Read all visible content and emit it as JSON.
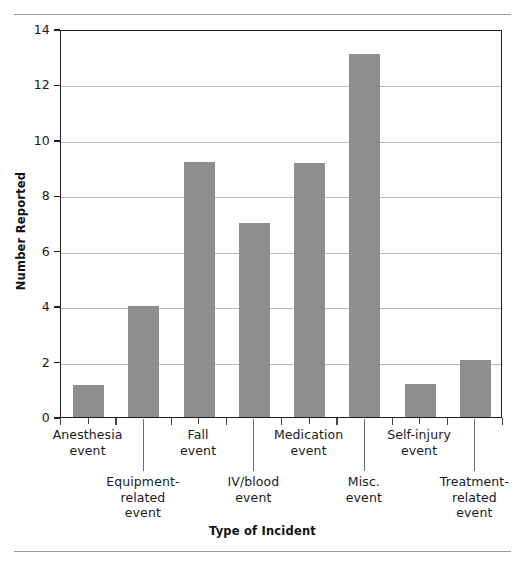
{
  "figure": {
    "background": "#ffffff",
    "bar_color": "#8e8e8e",
    "axis_color": "#1f1f1f",
    "gridline_color": "#b9b9b9",
    "rule_color": "#9a9a9a"
  },
  "chart_data": {
    "type": "bar",
    "title": "",
    "xlabel": "Type of Incident",
    "ylabel": "Number Reported",
    "ylim": [
      0,
      14
    ],
    "yticks": [
      0,
      2,
      4,
      6,
      8,
      10,
      12,
      14
    ],
    "grid": true,
    "legend": false,
    "orientation": "vertical",
    "categories": [
      "Anesthesia\nevent",
      "Equipment-\nrelated\nevent",
      "Fall\nevent",
      "IV/blood\nevent",
      "Medication\nevent",
      "Misc.\nevent",
      "Self-injury\nevent",
      "Treatment-\nrelated\nevent"
    ],
    "category_labels_flat": [
      "Anesthesia event",
      "Equipment-related event",
      "Fall event",
      "IV/blood event",
      "Medication event",
      "Misc. event",
      "Self-injury event",
      "Treatment-related event"
    ],
    "values": [
      1.15,
      4.0,
      9.2,
      7.0,
      9.15,
      13.1,
      1.2,
      2.05
    ],
    "tick_label_rows": [
      "upper",
      "lower",
      "upper",
      "lower",
      "upper",
      "lower",
      "upper",
      "lower"
    ]
  }
}
